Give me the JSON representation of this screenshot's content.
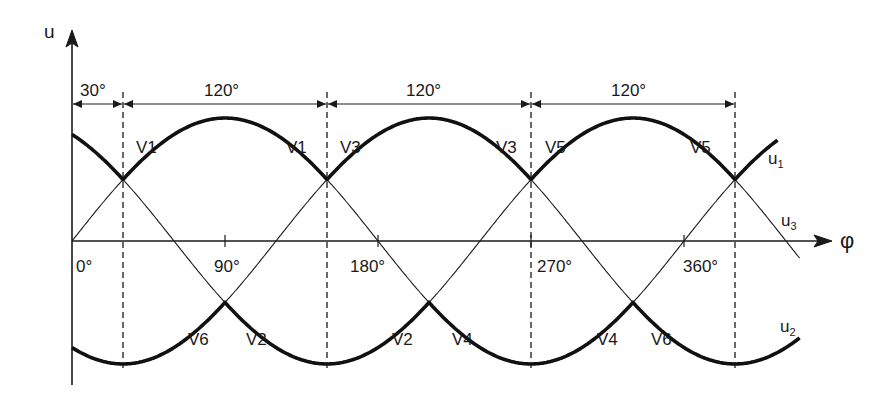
{
  "chart_data": {
    "type": "line",
    "title": "",
    "xlabel": "φ",
    "ylabel": "u",
    "x_unit": "degrees",
    "x_ticks": [
      {
        "value": 0,
        "label": "0°"
      },
      {
        "value": 90,
        "label": "90°"
      },
      {
        "value": 180,
        "label": "180°"
      },
      {
        "value": 270,
        "label": "270°"
      },
      {
        "value": 360,
        "label": "360°"
      }
    ],
    "x_range": [
      0,
      420
    ],
    "amplitude": 1,
    "series": [
      {
        "name": "u1",
        "label": "u",
        "sub": "1",
        "phase_deg": 0
      },
      {
        "name": "u2",
        "label": "u",
        "sub": "2",
        "phase_deg": 240
      },
      {
        "name": "u3",
        "label": "u",
        "sub": "3",
        "phase_deg": 120
      }
    ],
    "commutation_points_deg": [
      30,
      150,
      270,
      390
    ],
    "intervals": [
      {
        "from": 0,
        "to": 30,
        "label": "30°"
      },
      {
        "from": 30,
        "to": 150,
        "label": "120°"
      },
      {
        "from": 150,
        "to": 270,
        "label": "120°"
      },
      {
        "from": 270,
        "to": 390,
        "label": "120°"
      }
    ],
    "upper_labels": [
      {
        "text": "V1",
        "x": 136,
        "y": 151
      },
      {
        "text": "V1",
        "x": 286,
        "y": 151
      },
      {
        "text": "V3",
        "x": 340,
        "y": 151
      },
      {
        "text": "V3",
        "x": 496,
        "y": 151
      },
      {
        "text": "V5",
        "x": 545,
        "y": 151
      },
      {
        "text": "V5",
        "x": 690,
        "y": 151
      }
    ],
    "lower_labels": [
      {
        "text": "V6",
        "x": 188,
        "y": 343
      },
      {
        "text": "V2",
        "x": 246,
        "y": 343
      },
      {
        "text": "V2",
        "x": 392,
        "y": 343
      },
      {
        "text": "V4",
        "x": 452,
        "y": 343
      },
      {
        "text": "V4",
        "x": 597,
        "y": 343
      },
      {
        "text": "V6",
        "x": 651,
        "y": 343
      }
    ],
    "grid": false,
    "legend": "inline"
  },
  "labels": {
    "y_axis": "u",
    "x_axis": "φ",
    "u1": {
      "main": "u",
      "sub": "1"
    },
    "u2": {
      "main": "u",
      "sub": "2"
    },
    "u3": {
      "main": "u",
      "sub": "3"
    },
    "interval_0": "30°",
    "interval_1": "120°",
    "interval_2": "120°",
    "interval_3": "120°",
    "tick_0": "0°",
    "tick_90": "90°",
    "tick_180": "180°",
    "tick_270": "270°",
    "tick_360": "360°"
  }
}
